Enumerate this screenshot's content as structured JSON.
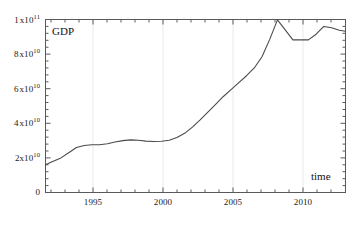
{
  "chart_data": {
    "type": "line",
    "title": "",
    "series_label": "GDP",
    "xlabel": "time",
    "ylabel": "GDP",
    "xlim": [
      1993.0,
      2012.4
    ],
    "ylim": [
      0,
      100000000000
    ],
    "grid": "vertical-only",
    "legend": "none",
    "x": [
      1993.0,
      1993.5,
      1994.0,
      1994.5,
      1995.0,
      1995.5,
      1996.0,
      1996.5,
      1997.0,
      1997.5,
      1998.0,
      1998.5,
      1999.0,
      1999.5,
      2000.0,
      2000.5,
      2001.0,
      2001.5,
      2002.0,
      2002.5,
      2003.0,
      2003.5,
      2004.0,
      2004.5,
      2005.0,
      2005.5,
      2006.0,
      2006.5,
      2007.0,
      2007.5,
      2008.0,
      2008.5,
      2009.0,
      2009.5,
      2010.0,
      2010.5,
      2011.0,
      2011.5,
      2012.0,
      2012.4
    ],
    "values": [
      16000000000,
      18000000000,
      20000000000,
      23000000000,
      26000000000,
      27200000000,
      27600000000,
      27600000000,
      28200000000,
      29200000000,
      30000000000,
      30400000000,
      30200000000,
      29700000000,
      29500000000,
      29600000000,
      30200000000,
      31800000000,
      34200000000,
      37800000000,
      42000000000,
      46500000000,
      51000000000,
      55500000000,
      59500000000,
      63500000000,
      67500000000,
      72000000000,
      78500000000,
      88500000000,
      99800000000,
      94000000000,
      88200000000,
      88200000000,
      88200000000,
      91500000000,
      96000000000,
      95200000000,
      93800000000,
      93200000000
    ],
    "y_ticks": [
      {
        "value": 0,
        "mantissa": "0",
        "exponent": "",
        "text": "0"
      },
      {
        "value": 20000000000,
        "mantissa": "2x10",
        "exponent": "10",
        "text": "2x10^10"
      },
      {
        "value": 40000000000,
        "mantissa": "4 x10",
        "exponent": "10",
        "text": "4 x10^10"
      },
      {
        "value": 60000000000,
        "mantissa": "6 x10",
        "exponent": "10",
        "text": "6 x10^10"
      },
      {
        "value": 80000000000,
        "mantissa": "8 x10",
        "exponent": "10",
        "text": "8 x10^10"
      },
      {
        "value": 100000000000,
        "mantissa": "1 x10",
        "exponent": "11",
        "text": "1 x10^11"
      }
    ],
    "x_ticks": [
      {
        "value": 1995,
        "text": "1995"
      },
      {
        "value": 2000,
        "text": "2000"
      },
      {
        "value": 2005,
        "text": "2005"
      },
      {
        "value": 2010,
        "text": "2010"
      }
    ],
    "x_minor_interval": 1,
    "y_minor_count": 4,
    "line_color": "#4a4a4a",
    "axis_color": "#555555",
    "grid_color": "#e8e8e8"
  }
}
